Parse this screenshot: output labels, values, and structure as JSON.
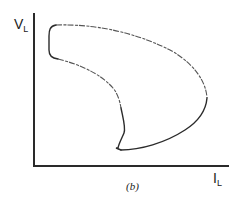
{
  "figure": {
    "caption": "(b)",
    "y_axis": {
      "symbol": "V",
      "subscript": "L"
    },
    "x_axis": {
      "symbol": "I",
      "subscript": "L"
    }
  }
}
